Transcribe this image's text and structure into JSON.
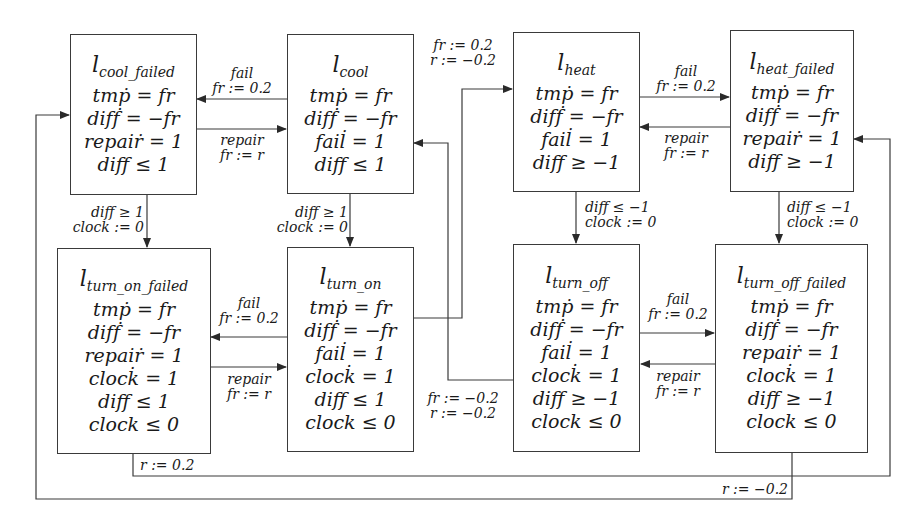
{
  "diagram": {
    "type": "hybrid-automaton",
    "locations": [
      {
        "id": "cool_failed",
        "title": "l",
        "sub": "cool_failed",
        "lines": [
          "tmṗ = fr",
          "difḟ = −fr",
          "repaiṙ = 1",
          "diff ≤ 1"
        ]
      },
      {
        "id": "cool",
        "title": "l",
        "sub": "cool",
        "lines": [
          "tmṗ = fr",
          "difḟ = −fr",
          "fail̇ = 1",
          "diff ≤ 1"
        ]
      },
      {
        "id": "heat",
        "title": "l",
        "sub": "heat",
        "lines": [
          "tmṗ = fr",
          "difḟ = −fr",
          "fail̇ = 1",
          "diff ≥ −1"
        ]
      },
      {
        "id": "heat_failed",
        "title": "l",
        "sub": "heat_failed",
        "lines": [
          "tmṗ = fr",
          "difḟ = −fr",
          "repaiṙ = 1",
          "diff ≥ −1"
        ]
      },
      {
        "id": "turn_on_failed",
        "title": "l",
        "sub": "turn_on_failed",
        "lines": [
          "tmṗ = fr",
          "difḟ = −fr",
          "repaiṙ = 1",
          "clock̇ = 1",
          "diff ≤ 1",
          "clock ≤ 0"
        ]
      },
      {
        "id": "turn_on",
        "title": "l",
        "sub": "turn_on",
        "lines": [
          "tmṗ = fr",
          "difḟ = −fr",
          "fail̇ = 1",
          "clock̇ = 1",
          "diff ≤ 1",
          "clock ≤ 0"
        ]
      },
      {
        "id": "turn_off",
        "title": "l",
        "sub": "turn_off",
        "lines": [
          "tmṗ = fr",
          "difḟ = −fr",
          "fail̇ = 1",
          "clock̇ = 1",
          "diff ≥ −1",
          "clock ≤ 0"
        ]
      },
      {
        "id": "turn_off_failed",
        "title": "l",
        "sub": "turn_off_failed",
        "lines": [
          "tmṗ = fr",
          "difḟ = −fr",
          "repaiṙ = 1",
          "clock̇ = 1",
          "diff ≥ −1",
          "clock ≤ 0"
        ]
      }
    ],
    "edges": [
      {
        "from": "cool",
        "to": "cool_failed",
        "label": [
          "fail",
          "fr := 0.2"
        ]
      },
      {
        "from": "cool_failed",
        "to": "cool",
        "label": [
          "repair",
          "fr := r"
        ]
      },
      {
        "from": "heat",
        "to": "heat_failed",
        "label": [
          "fail",
          "fr := 0.2"
        ]
      },
      {
        "from": "heat_failed",
        "to": "heat",
        "label": [
          "repair",
          "fr := r"
        ]
      },
      {
        "from": "turn_on",
        "to": "turn_on_failed",
        "label": [
          "fail",
          "fr := 0.2"
        ]
      },
      {
        "from": "turn_on_failed",
        "to": "turn_on",
        "label": [
          "repair",
          "fr := r"
        ]
      },
      {
        "from": "turn_off",
        "to": "turn_off_failed",
        "label": [
          "fail",
          "fr := 0.2"
        ]
      },
      {
        "from": "turn_off_failed",
        "to": "turn_off",
        "label": [
          "repair",
          "fr := r"
        ]
      },
      {
        "from": "cool_failed",
        "to": "turn_on_failed",
        "label": [
          "diff ≥ 1",
          "clock := 0"
        ]
      },
      {
        "from": "cool",
        "to": "turn_on",
        "label": [
          "diff ≥ 1",
          "clock := 0"
        ]
      },
      {
        "from": "heat",
        "to": "turn_off",
        "label": [
          "diff ≤ −1",
          "clock := 0"
        ]
      },
      {
        "from": "heat_failed",
        "to": "turn_off_failed",
        "label": [
          "diff ≤ −1",
          "clock := 0"
        ]
      },
      {
        "from": "turn_on",
        "to": "heat",
        "label": [
          "fr := 0.2",
          "r := −0.2"
        ]
      },
      {
        "from": "turn_off",
        "to": "cool",
        "label": [
          "fr := −0.2",
          "r := −0.2"
        ]
      },
      {
        "from": "turn_on_failed",
        "to": "heat_failed",
        "label": [
          "r := 0.2"
        ]
      },
      {
        "from": "turn_off_failed",
        "to": "cool_failed",
        "label": [
          "r := −0.2"
        ]
      }
    ],
    "colors": {
      "stroke": "#3a3a3a",
      "text": "#1a1a1a",
      "background": "#ffffff"
    }
  }
}
